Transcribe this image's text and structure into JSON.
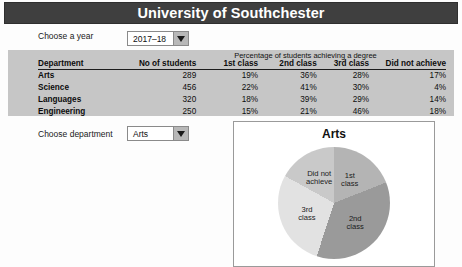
{
  "header": {
    "title": "University of Southchester",
    "bar_color": "#3f3f3f"
  },
  "year_chooser": {
    "label": "Choose a year",
    "selected": "2017–18"
  },
  "table": {
    "group_header": "Percentage of students achieving a degree",
    "columns": [
      "Department",
      "No of students",
      "1st class",
      "2nd class",
      "3rd class",
      "Did not achieve"
    ],
    "rows": [
      {
        "department": "Arts",
        "students": "289",
        "first": "19%",
        "second": "36%",
        "third": "28%",
        "none": "17%"
      },
      {
        "department": "Science",
        "students": "456",
        "first": "22%",
        "second": "41%",
        "third": "30%",
        "none": "4%"
      },
      {
        "department": "Languages",
        "students": "320",
        "first": "18%",
        "second": "39%",
        "third": "29%",
        "none": "14%"
      },
      {
        "department": "Engineering",
        "students": "250",
        "first": "15%",
        "second": "21%",
        "third": "46%",
        "none": "18%"
      }
    ]
  },
  "department_chooser": {
    "label": "Choose department",
    "selected": "Arts"
  },
  "chart_data": {
    "type": "pie",
    "title": "Arts",
    "labels": [
      "1st class",
      "2nd class",
      "3rd class",
      "Did not achieve"
    ],
    "values": [
      19,
      36,
      28,
      17
    ],
    "unit": "%",
    "colors": [
      "#b4b4b4",
      "#9a9a9a",
      "#e2e2e2",
      "#c9c9c9"
    ],
    "start_angle_deg": 0,
    "direction": "clockwise",
    "legend": "none",
    "slice_label_text": [
      "1st\nclass",
      "2nd\nclass",
      "3rd\nclass",
      "Did not\nachieve"
    ]
  }
}
